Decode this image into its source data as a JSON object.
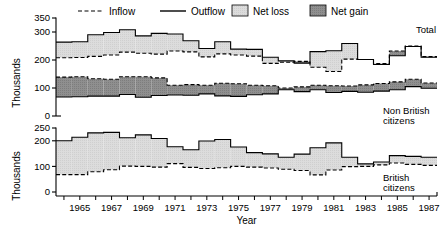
{
  "chart_data": {
    "type": "area",
    "title": "",
    "xlabel": "Year",
    "ylabel": "Thousands",
    "grid": false,
    "legend_position": "top",
    "legend": [
      {
        "name": "Inflow",
        "style": "dashed-line",
        "color": "#000000"
      },
      {
        "name": "Outflow",
        "style": "solid-line",
        "color": "#000000"
      },
      {
        "name": "Net loss",
        "style": "swatch",
        "color": "#d8d8d8"
      },
      {
        "name": "Net gain",
        "style": "swatch",
        "color": "#8a8a8a"
      }
    ],
    "x": [
      1964,
      1965,
      1966,
      1967,
      1968,
      1969,
      1970,
      1971,
      1972,
      1973,
      1974,
      1975,
      1976,
      1977,
      1978,
      1979,
      1980,
      1981,
      1982,
      1983,
      1984,
      1985,
      1986,
      1987
    ],
    "tick_labels": [
      "1965",
      "1967",
      "1969",
      "1971",
      "1973",
      "1975",
      "1977",
      "1979",
      "1981",
      "1983",
      "1985",
      "1987"
    ],
    "tick_years": [
      1965,
      1967,
      1969,
      1971,
      1973,
      1975,
      1977,
      1979,
      1981,
      1983,
      1985,
      1987
    ],
    "panels": [
      {
        "label": "Total",
        "ylim": [
          0,
          350
        ],
        "yticks": [
          0,
          100,
          200,
          300,
          350
        ],
        "ylabel": "Thousands",
        "series": [
          {
            "name": "Inflow",
            "values": [
              208,
              209,
              213,
              218,
              228,
              224,
              221,
              232,
              229,
              211,
              222,
              218,
              214,
              188,
              192,
              195,
              174,
              159,
              203,
              202,
              187,
              232,
              250,
              212
            ]
          },
          {
            "name": "Outflow",
            "values": [
              264,
              265,
              290,
              298,
              308,
              286,
              295,
              293,
              269,
              241,
              265,
              239,
              238,
              210,
              197,
              189,
              230,
              233,
              259,
              202,
              184,
              215,
              248,
              210
            ]
          }
        ]
      },
      {
        "label": "Non British citizens",
        "ylim": [
          0,
          350
        ],
        "yticks": [
          0,
          100,
          200,
          300,
          350
        ],
        "ylabel": "Thousands",
        "series": [
          {
            "name": "Inflow",
            "values": [
              139,
              140,
              133,
              131,
              140,
              140,
              136,
              110,
              112,
              110,
              117,
              115,
              110,
              108,
              100,
              104,
              110,
              108,
              107,
              111,
              116,
              122,
              131,
              118
            ]
          },
          {
            "name": "Outflow",
            "values": [
              68,
              69,
              71,
              71,
              77,
              67,
              73,
              75,
              74,
              79,
              72,
              70,
              76,
              79,
              94,
              87,
              94,
              84,
              88,
              85,
              89,
              94,
              105,
              99
            ]
          }
        ]
      },
      {
        "label": "British citizens",
        "ylim": [
          0,
          250
        ],
        "yticks": [
          0,
          100,
          200,
          250
        ],
        "ylabel": "Thousands",
        "series": [
          {
            "name": "Inflow",
            "values": [
              68,
              68,
              79,
              87,
              101,
              100,
              97,
              111,
              96,
              92,
              95,
              100,
              97,
              94,
              89,
              84,
              67,
              86,
              99,
              100,
              106,
              113,
              108,
              104
            ]
          },
          {
            "name": "Outflow",
            "values": [
              200,
              214,
              231,
              233,
              212,
              223,
              209,
              177,
              165,
              199,
              205,
              176,
              154,
              149,
              136,
              148,
              173,
              192,
              136,
              110,
              117,
              142,
              139,
              136
            ]
          }
        ]
      }
    ]
  },
  "axis": {
    "x_title": "Year",
    "y_title": "Thousands"
  }
}
